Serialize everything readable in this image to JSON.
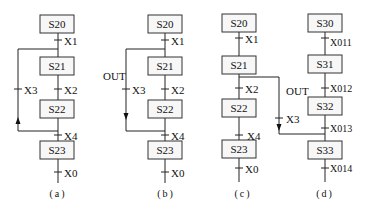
{
  "diagrams": {
    "a": {
      "caption": "(a)",
      "steps": [
        "S20",
        "S21",
        "S22",
        "S23"
      ],
      "transitions": {
        "t1": "X1",
        "t2": "X2",
        "t3": "X3",
        "t4": "X4",
        "t5": "X0"
      }
    },
    "b": {
      "caption": "(b)",
      "steps": [
        "S20",
        "S21",
        "S22",
        "S23"
      ],
      "transitions": {
        "t1": "X1",
        "t2": "X2",
        "t3": "X3",
        "t4": "X4",
        "t5": "X0"
      },
      "branch_label": "OUT"
    },
    "c": {
      "caption": "(c)",
      "steps": [
        "S20",
        "S21",
        "S22",
        "S23"
      ],
      "transitions": {
        "t1": "X1",
        "t2": "X2",
        "t4": "X4",
        "t5": "X0"
      }
    },
    "d": {
      "caption": "(d)",
      "steps": [
        "S30",
        "S31",
        "S32",
        "S33"
      ],
      "transitions": {
        "t1": "X011",
        "t2": "X012",
        "t3": "X013",
        "t4": "X014"
      }
    },
    "cd_link": {
      "transition": "X3",
      "branch_label": "OUT"
    }
  }
}
